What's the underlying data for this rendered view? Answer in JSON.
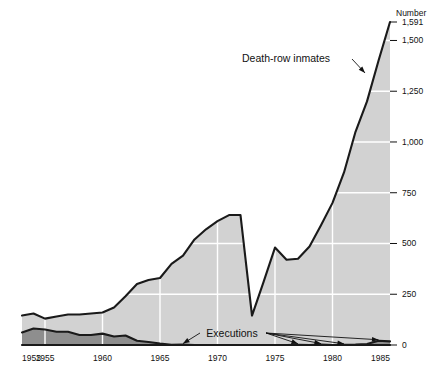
{
  "chart_data": {
    "type": "area",
    "title": "",
    "xlabel": "",
    "ylabel": "Number",
    "yaxis_title": "Number",
    "xlim": [
      1953,
      1985
    ],
    "ylim": [
      0,
      1591
    ],
    "grid": true,
    "legend_position": "none",
    "x_ticks": [
      "1953",
      "1955",
      "1960",
      "1965",
      "1970",
      "1975",
      "1980",
      "1985"
    ],
    "x_tick_values": [
      1953,
      1955,
      1960,
      1965,
      1970,
      1975,
      1980,
      1985
    ],
    "y_ticks": [
      "0",
      "250",
      "500",
      "750",
      "1,000",
      "1,250",
      "1,500",
      "1,591"
    ],
    "y_tick_values": [
      0,
      250,
      500,
      750,
      1000,
      1250,
      1500,
      1591
    ],
    "colors": {
      "inmates_fill": "#d2d2d2",
      "executions_fill": "#8e8e8e",
      "line": "#1a1a1a",
      "grid": "#ffffff",
      "text": "#111111",
      "background": "#ffffff"
    },
    "annotations": [
      {
        "text": "Death-row inmates",
        "points_to_year": 1983,
        "points_to_value": 1340
      },
      {
        "text": "Executions",
        "points_to_years": [
          1967,
          1977,
          1979,
          1981,
          1984
        ]
      }
    ],
    "series": [
      {
        "name": "Death-row inmates",
        "x": [
          1953,
          1954,
          1955,
          1956,
          1957,
          1958,
          1959,
          1960,
          1961,
          1962,
          1963,
          1964,
          1965,
          1966,
          1967,
          1968,
          1969,
          1970,
          1971,
          1972,
          1973,
          1974,
          1975,
          1976,
          1977,
          1978,
          1979,
          1980,
          1981,
          1982,
          1983,
          1984,
          1985
        ],
        "values": [
          145,
          155,
          130,
          140,
          150,
          150,
          155,
          160,
          185,
          240,
          300,
          320,
          330,
          400,
          440,
          520,
          570,
          610,
          640,
          640,
          145,
          310,
          480,
          420,
          425,
          485,
          590,
          700,
          850,
          1050,
          1200,
          1400,
          1591
        ]
      },
      {
        "name": "Executions",
        "x": [
          1953,
          1954,
          1955,
          1956,
          1957,
          1958,
          1959,
          1960,
          1961,
          1962,
          1963,
          1964,
          1965,
          1966,
          1967,
          1968,
          1969,
          1970,
          1971,
          1972,
          1973,
          1974,
          1975,
          1976,
          1977,
          1978,
          1979,
          1980,
          1981,
          1982,
          1983,
          1984,
          1985
        ],
        "values": [
          62,
          81,
          76,
          65,
          65,
          49,
          49,
          56,
          42,
          47,
          21,
          15,
          7,
          1,
          2,
          0,
          0,
          0,
          0,
          0,
          0,
          0,
          0,
          0,
          1,
          0,
          2,
          0,
          1,
          2,
          5,
          21,
          18
        ]
      }
    ]
  }
}
